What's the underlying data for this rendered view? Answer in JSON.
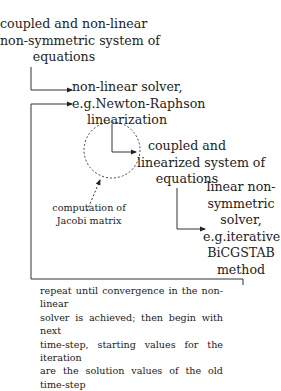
{
  "nodes": {
    "system": [
      "coupled and non-linear",
      "non-symmetric system of",
      "equations"
    ],
    "nonlinear_solver": [
      "non-linear solver,",
      "e.g.Newton-Raphson",
      "linearization"
    ],
    "linearized_system": [
      "coupled and",
      "linearized system of",
      "equations"
    ],
    "linear_solver": [
      "linear non-",
      "symmetric",
      "solver,",
      "e.g.iterative",
      "BiCGSTAB",
      "method"
    ],
    "jacobi": [
      "computation of",
      "Jacobi matrix"
    ]
  },
  "loop_note": [
    "repeat until convergence in the non-linear",
    "solver is achieved; then begin with next",
    "time-step, starting values for the iteration",
    "are the solution values of the old time-step"
  ]
}
